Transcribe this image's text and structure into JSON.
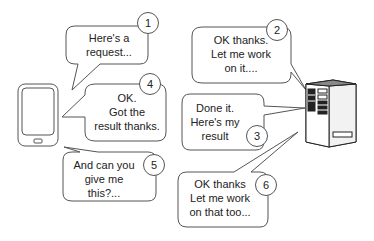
{
  "diagram": {
    "actors": {
      "client": "mobile-phone",
      "server": "server-tower"
    },
    "bubbles": [
      {
        "step": "1",
        "text": "Here's a\nrequest..."
      },
      {
        "step": "2",
        "text": "OK thanks.\nLet me work\non it...."
      },
      {
        "step": "3",
        "text": "Done it.\nHere's my\nresult"
      },
      {
        "step": "4",
        "text": "OK.\nGot the\nresult thanks."
      },
      {
        "step": "5",
        "text": "And can you\ngive me\nthis?..."
      },
      {
        "step": "6",
        "text": "OK thanks\nLet me work\non that too..."
      }
    ],
    "colors": {
      "stroke": "#555555",
      "text": "#222222",
      "server_dark": "#333333",
      "server_face": "#e8e8e8"
    }
  }
}
